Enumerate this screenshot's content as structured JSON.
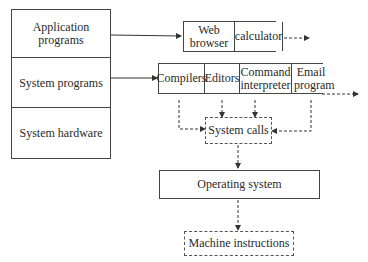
{
  "layers": [
    {
      "label": "Application programs"
    },
    {
      "label": "System programs"
    },
    {
      "label": "System hardware"
    }
  ],
  "application_programs": [
    "Web browser",
    "calculator"
  ],
  "system_programs": [
    "Compilers",
    "Editors",
    "Command interpreter",
    "Email program"
  ],
  "system_calls": "System calls",
  "operating_system": "Operating system",
  "machine_instructions": "Machine instructions"
}
